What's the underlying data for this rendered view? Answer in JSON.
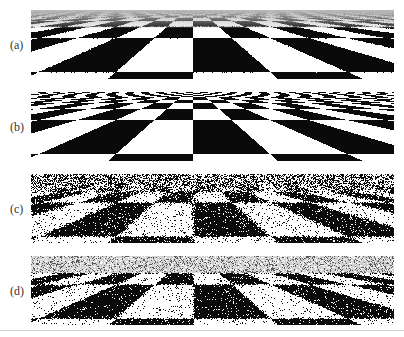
{
  "figure": {
    "panels": [
      {
        "id": "a",
        "label": "(a)",
        "top": 10,
        "mode": "filtered",
        "description": "checkerboard rendered with texture filtering; distance fades to gray"
      },
      {
        "id": "b",
        "label": "(b)",
        "top": 92,
        "mode": "aliased",
        "description": "checkerboard point-sampled; moire aliasing near horizon"
      },
      {
        "id": "c",
        "label": "(c)",
        "top": 174,
        "mode": "noise-heavy",
        "description": "checkerboard with heavy random sampling noise"
      },
      {
        "id": "d",
        "label": "(d)",
        "top": 256,
        "mode": "noise-light",
        "description": "checkerboard with lighter sampling noise, grayish far field"
      }
    ],
    "colors": {
      "dark": "#0a0a0a",
      "light": "#ffffff",
      "far_gray": "#b8b8b8",
      "rule": "#d0d0d0"
    }
  }
}
